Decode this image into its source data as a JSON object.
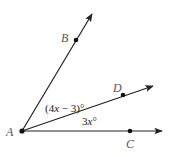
{
  "diagram": {
    "type": "angle-diagram",
    "colors": {
      "line": "#222222",
      "label": "#555555",
      "background": "#ffffff"
    },
    "vertex": {
      "label": "A",
      "x": 22,
      "y": 131
    },
    "rays": [
      {
        "name": "ray-AB",
        "to": {
          "x": 92,
          "y": 13
        },
        "point": {
          "label": "B",
          "x": 76,
          "y": 40
        }
      },
      {
        "name": "ray-AD",
        "to": {
          "x": 154,
          "y": 85
        },
        "point": {
          "label": "D",
          "x": 123,
          "y": 95
        }
      },
      {
        "name": "ray-AC",
        "to": {
          "x": 163,
          "y": 131
        },
        "point": {
          "label": "C",
          "x": 130,
          "y": 131
        }
      }
    ],
    "labels": {
      "A": "A",
      "B": "B",
      "C": "C",
      "D": "D"
    },
    "angles": {
      "BAD": {
        "pre": "(4",
        "var": "x",
        "post": " − 3)°"
      },
      "DAC": {
        "pre": "3",
        "var": "x",
        "post": "°"
      }
    }
  }
}
